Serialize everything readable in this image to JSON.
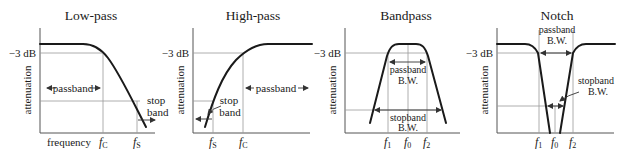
{
  "figure": {
    "panels": [
      {
        "title": "Low-pass",
        "y_axis_label": "attenuation",
        "level_label": "−3 dB",
        "x_axis_label": "frequency",
        "freq_marks": [
          {
            "main": "f",
            "sub": "C"
          },
          {
            "main": "f",
            "sub": "S"
          }
        ],
        "region_labels": {
          "passband": "passband",
          "stop_line1": "stop",
          "stop_line2": "band"
        }
      },
      {
        "title": "High-pass",
        "y_axis_label": "attenuation",
        "level_label": "−3 dB",
        "freq_marks": [
          {
            "main": "f",
            "sub": "S"
          },
          {
            "main": "f",
            "sub": "C"
          }
        ],
        "region_labels": {
          "passband": "passband",
          "stop_line1": "stop",
          "stop_line2": "band"
        }
      },
      {
        "title": "Bandpass",
        "y_axis_label": "attenuation",
        "level_label": "−3 dB",
        "freq_marks": [
          {
            "main": "f",
            "sub": "1"
          },
          {
            "main": "f",
            "sub": "0"
          },
          {
            "main": "f",
            "sub": "2"
          }
        ],
        "region_labels": {
          "pass_line1": "passband",
          "pass_line2": "B.W.",
          "stop_line1": "stopband",
          "stop_line2": "B.W."
        }
      },
      {
        "title": "Notch",
        "y_axis_label": "attenuation",
        "level_label": "−3 dB",
        "freq_marks": [
          {
            "main": "f",
            "sub": "1"
          },
          {
            "main": "f",
            "sub": "0"
          },
          {
            "main": "f",
            "sub": "2"
          }
        ],
        "region_labels": {
          "pass_line1": "passband",
          "pass_line2": "B.W.",
          "stop_line1": "stopband",
          "stop_line2": "B.W."
        }
      }
    ]
  }
}
